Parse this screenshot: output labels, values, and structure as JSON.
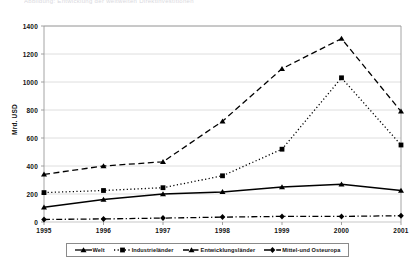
{
  "cut_title": "Abbildung: Entwicklung der weltweiten Direktinvestitionen",
  "axis": {
    "ylabel": "Mrd. USD",
    "yticks": [
      0,
      200,
      400,
      600,
      800,
      1000,
      1200,
      1400
    ],
    "xticks": [
      "1995",
      "1996",
      "1997",
      "1998",
      "1999",
      "2000",
      "2001"
    ]
  },
  "legend": {
    "items": [
      {
        "label": "Welt",
        "marker": "triangle",
        "dash": "solid",
        "color": "#000000"
      },
      {
        "label": "Industrieländer",
        "marker": "square",
        "dash": "dotted",
        "color": "#000000"
      },
      {
        "label": "Entwicklungsländer",
        "marker": "triangle",
        "dash": "dashed",
        "color": "#000000"
      },
      {
        "label": "Mittel-und Osteuropa",
        "marker": "diamond",
        "dash": "dashdot",
        "color": "#000000"
      }
    ]
  },
  "chart_data": {
    "type": "line",
    "title": "",
    "xlabel": "",
    "ylabel": "Mrd. USD",
    "x": [
      "1995",
      "1996",
      "1997",
      "1998",
      "1999",
      "2000",
      "2001"
    ],
    "xlim": [
      "1995",
      "2001"
    ],
    "ylim": [
      0,
      1400
    ],
    "ytick_step": 200,
    "grid": "horizontal",
    "legend_position": "bottom",
    "series": [
      {
        "name": "Welt",
        "marker": "triangle",
        "dash": "solid",
        "color": "#000000",
        "values": [
          105,
          160,
          200,
          215,
          250,
          270,
          225
        ]
      },
      {
        "name": "Industrieländer",
        "marker": "square",
        "dash": "dotted",
        "color": "#000000",
        "values": [
          210,
          225,
          245,
          330,
          520,
          1030,
          550
        ]
      },
      {
        "name": "Entwicklungsländer",
        "marker": "triangle",
        "dash": "dashed",
        "color": "#000000",
        "values": [
          340,
          400,
          430,
          720,
          1095,
          1310,
          790
        ]
      },
      {
        "name": "Mittel-und Osteuropa",
        "marker": "diamond",
        "dash": "dashdot",
        "color": "#000000",
        "values": [
          18,
          22,
          28,
          35,
          40,
          40,
          45
        ]
      }
    ]
  }
}
